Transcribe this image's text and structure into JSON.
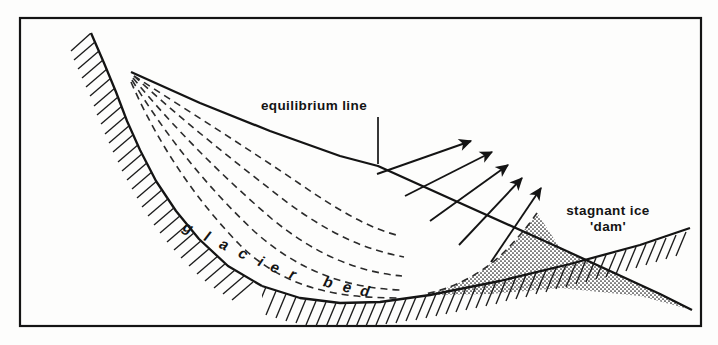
{
  "figure": {
    "kind": "cross-section-diagram",
    "background_color": "#fdfdfc",
    "ink_color": "#141414",
    "frame": {
      "x": 20,
      "y": 18,
      "width": 681,
      "height": 308,
      "stroke_width": 2.2
    }
  },
  "labels": {
    "equilibrium_line": "equilibrium line",
    "stagnant_ice_line1": "stagnant ice",
    "stagnant_ice_line2": "'dam'",
    "glacier_bed_letters": [
      "g",
      "l",
      "a",
      "c",
      "i",
      "e",
      "r",
      "b",
      "e",
      "d"
    ],
    "glacier_bed_text": "glacier bed"
  },
  "glacier_bed_letter_positions": [
    {
      "ch": "g",
      "x": 186,
      "y": 232,
      "rot": 26
    },
    {
      "ch": "l",
      "x": 205,
      "y": 241,
      "rot": 26
    },
    {
      "ch": "a",
      "x": 222,
      "y": 249,
      "rot": 26
    },
    {
      "ch": "c",
      "x": 241,
      "y": 258,
      "rot": 26
    },
    {
      "ch": "i",
      "x": 259,
      "y": 266,
      "rot": 24
    },
    {
      "ch": "e",
      "x": 273,
      "y": 272,
      "rot": 22
    },
    {
      "ch": "r",
      "x": 291,
      "y": 279,
      "rot": 20
    },
    {
      "ch": "b",
      "x": 327,
      "y": 287,
      "rot": 14
    },
    {
      "ch": "e",
      "x": 346,
      "y": 292,
      "rot": 12
    },
    {
      "ch": "d",
      "x": 364,
      "y": 296,
      "rot": 10
    }
  ],
  "geometry": {
    "rock_wall": {
      "description": "hatched bedrock headwall, upper left, hatching on outer (left) side",
      "path": "M 91,33 L 104,63 L 116,92 L 127,121 L 140,150 L 156,181 L 176,211 L 199,239 L 228,266 L 262,286",
      "hatch_side": "left",
      "hatch_count": 34
    },
    "glacier_bed": {
      "description": "hatched bed line continuing from headwall to terminus, hatching below",
      "path": "M 262,286 L 300,298 L 340,303 L 380,302 L 430,295 L 500,281 L 570,264 L 640,245 L 690,228",
      "hatch_side": "below",
      "hatch_count": 40
    },
    "glacier_surface": {
      "description": "upper ice surface from headwall apex down to terminus point",
      "path": "M 131,72 L 200,103 L 270,131 L 340,156 L 378,166 L 460,203 L 560,248 L 660,294 L 692,310"
    },
    "flowlines": {
      "count": 5,
      "style": "dashed",
      "dasharray": "7,5",
      "description": "nested dashed ice-flow lines from surface near headwall curving down to the bed"
    },
    "stagnant_ice_dam": {
      "fill": "stipple-dots",
      "description": "stippled wedge between surface line and bed line at the terminus, bounded upper-left by the lowest flowline"
    },
    "arrows": {
      "count": 5,
      "direction": "up-and-right",
      "description": "five flow arrows crossing the surface line above the stagnant dam"
    },
    "equilibrium_leader": {
      "description": "vertical leader from the label down to the surface kink",
      "x": 378,
      "y_top": 117,
      "y_bottom": 164
    }
  },
  "label_positions": {
    "equilibrium_line": {
      "x": 314,
      "y": 110
    },
    "stagnant_ice_line1": {
      "x": 608,
      "y": 215
    },
    "stagnant_ice_line2": {
      "x": 608,
      "y": 230
    }
  }
}
